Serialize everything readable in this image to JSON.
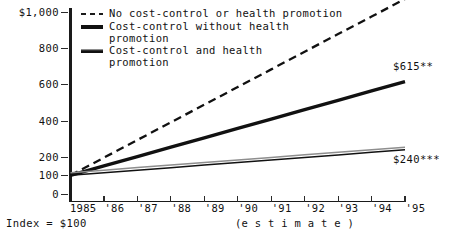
{
  "chart_data": {
    "type": "line",
    "title": "",
    "xlabel": "",
    "ylabel": "",
    "x": [
      "1985",
      "'86",
      "'87",
      "'88",
      "'89",
      "'90",
      "'91",
      "'92",
      "'93",
      "'94",
      "'95"
    ],
    "xlim": [
      1985,
      1995
    ],
    "ylim": [
      0,
      1000
    ],
    "yticks": [
      0,
      100,
      200,
      400,
      600,
      800,
      1000
    ],
    "ytick_labels": [
      "0",
      "100",
      "200",
      "400",
      "600",
      "800",
      "$1,000"
    ],
    "grid": false,
    "legend_position": "top-left",
    "axis_note": "(e s t i m a t e )",
    "index_note": "Index = $100",
    "series": [
      {
        "name": "No cost-control or health promotion",
        "style": "dashed",
        "values": [
          100,
          197,
          294,
          391,
          488,
          585,
          682,
          779,
          876,
          972,
          1069
        ],
        "end_label": "$1,069*"
      },
      {
        "name": "Cost-control without health promotion",
        "style": "solid-thick",
        "values": [
          100,
          152,
          203,
          255,
          306,
          358,
          409,
          461,
          512,
          564,
          615
        ],
        "end_label": "$615**"
      },
      {
        "name": "Cost-control and health promotion",
        "style": "double-thin",
        "values": [
          100,
          114,
          128,
          142,
          156,
          170,
          184,
          198,
          212,
          226,
          240
        ],
        "end_label": "$240***"
      }
    ]
  },
  "legend": {
    "items": [
      {
        "label": "No cost-control or health promotion",
        "swatch": "dashed"
      },
      {
        "label": "Cost-control without health\npromotion",
        "swatch": "solid"
      },
      {
        "label": "Cost-control and health\npromotion",
        "swatch": "double"
      }
    ]
  },
  "y_axis": {
    "ticks": [
      {
        "label": "$1,000",
        "value": 1000
      },
      {
        "label": "800",
        "value": 800
      },
      {
        "label": "600",
        "value": 600
      },
      {
        "label": "400",
        "value": 400
      },
      {
        "label": "200",
        "value": 200
      },
      {
        "label": "100",
        "value": 100
      },
      {
        "label": "0",
        "value": 0
      }
    ]
  },
  "x_axis": {
    "ticks": [
      "1985",
      "'86",
      "'87",
      "'88",
      "'89",
      "'90",
      "'91",
      "'92",
      "'93",
      "'94",
      "'95"
    ],
    "note": "(e s t i m a t e )"
  },
  "value_labels": [
    {
      "text": "$1,069*",
      "series": "No cost-control or health promotion"
    },
    {
      "text": "$615**",
      "series": "Cost-control without health promotion"
    },
    {
      "text": "$240***",
      "series": "Cost-control and health promotion"
    }
  ],
  "footnote": {
    "index_note": "Index = $100"
  },
  "colors": {
    "line": "#111111",
    "axis": "#1a1a1a",
    "secondary_line": "#8e8e8e",
    "background": "#ffffff"
  }
}
